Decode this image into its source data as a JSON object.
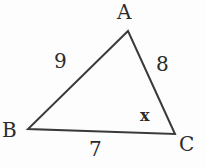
{
  "figure": {
    "kind": "triangle-diagram",
    "background_color": "#fdfdfd",
    "stroke_color": "#3a3a3a",
    "text_color": "#2b2b2b",
    "stroke_width": 2,
    "vertices": {
      "A": {
        "label": "A",
        "x": 128,
        "y": 31
      },
      "B": {
        "label": "B",
        "x": 28,
        "y": 129
      },
      "C": {
        "label": "C",
        "x": 175,
        "y": 134
      }
    },
    "vertex_labels": {
      "A": "A",
      "B": "B",
      "C": "C"
    },
    "side_labels": {
      "AB": "9",
      "AC": "8",
      "BC": "7"
    },
    "angle_labels": {
      "C": "x"
    },
    "path": "M128,31 L28,129 L175,134 Z"
  }
}
